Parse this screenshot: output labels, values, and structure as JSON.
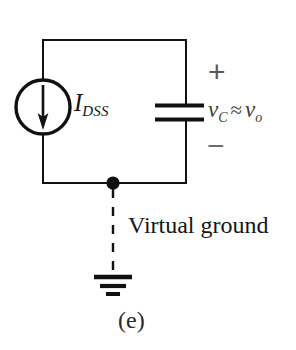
{
  "figure": {
    "caption": "(e)",
    "background_color": "#ffffff",
    "line_color": "#111111"
  },
  "circuit": {
    "title": "Virtual ground current-source charging a capacitor",
    "source": {
      "type": "current-source",
      "label_main": "I",
      "label_sub": "DSS",
      "arrow_direction": "down",
      "symbol": "circle-with-arrow"
    },
    "capacitor": {
      "symbol": "parallel-plate",
      "voltage_label_main": "v",
      "voltage_label_sub": "C",
      "relation": "≈",
      "voltage_label_2_main": "v",
      "voltage_label_2_sub": "o",
      "polarity_plus": "+",
      "polarity_minus": "−"
    },
    "node": {
      "label": "Virtual ground",
      "marker": "junction-dot",
      "connection_style": "dashed"
    },
    "ground": {
      "symbol": "earth-ground",
      "bars": 3
    }
  }
}
